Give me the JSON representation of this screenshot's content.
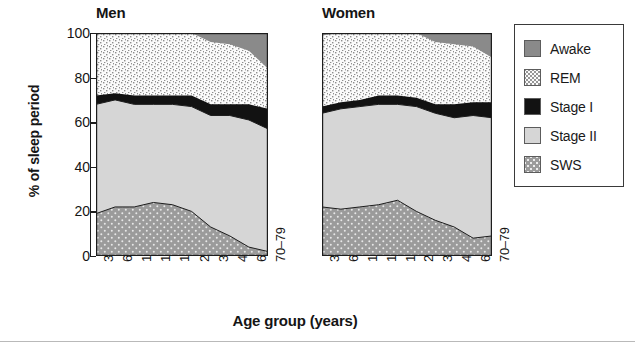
{
  "figure": {
    "ylabel": "% of sleep period",
    "xlabel": "Age group (years)",
    "panels": [
      {
        "id": "men",
        "title": "Men"
      },
      {
        "id": "women",
        "title": "Women"
      }
    ]
  },
  "legend": {
    "items": [
      {
        "label": "Awake",
        "key": "awake",
        "color": "#8a8a8a",
        "pattern": "solid"
      },
      {
        "label": "REM",
        "key": "rem",
        "color": "#f2f2f2",
        "pattern": "dotted-light"
      },
      {
        "label": "Stage I",
        "key": "stage_i",
        "color": "#121212",
        "pattern": "solid"
      },
      {
        "label": "Stage II",
        "key": "stage_ii",
        "color": "#d6d6d6",
        "pattern": "solid"
      },
      {
        "label": "SWS",
        "key": "sws",
        "color": "#9b9b9b",
        "pattern": "dotted-dark"
      }
    ]
  },
  "chart_data": {
    "type": "area",
    "title": "",
    "xlabel": "Age group (years)",
    "ylabel": "% of sleep period",
    "ylim": [
      0,
      100
    ],
    "yticks": [
      0,
      20,
      40,
      60,
      80,
      100
    ],
    "grid": false,
    "stacked": true,
    "legend_position": "right",
    "categories": [
      "3–5",
      "6–9",
      "10–12",
      "13–15",
      "16–19",
      "20–29",
      "30–39",
      "40–59",
      "60–69",
      "70–79"
    ],
    "stack_order_bottom_to_top": [
      "SWS",
      "Stage II",
      "Stage I",
      "REM",
      "Awake"
    ],
    "panels": [
      {
        "name": "Men",
        "series": [
          {
            "name": "SWS",
            "values": [
              19,
              22,
              22,
              24,
              23,
              20,
              13,
              9,
              4,
              2
            ]
          },
          {
            "name": "Stage II",
            "values": [
              49,
              48,
              46,
              44,
              45,
              47,
              50,
              54,
              57,
              55
            ]
          },
          {
            "name": "Stage I",
            "values": [
              4,
              3,
              4,
              4,
              4,
              5,
              5,
              5,
              7,
              9
            ]
          },
          {
            "name": "REM",
            "values": [
              28,
              27,
              28,
              28,
              28,
              28,
              28,
              27,
              24,
              18
            ]
          },
          {
            "name": "Awake",
            "values": [
              0,
              0,
              0,
              0,
              0,
              0,
              4,
              5,
              8,
              16
            ]
          }
        ],
        "cumulative_tops": {
          "sws": [
            19,
            22,
            22,
            24,
            23,
            20,
            13,
            9,
            4,
            2
          ],
          "stage_ii": [
            68,
            70,
            68,
            68,
            68,
            67,
            63,
            63,
            61,
            57
          ],
          "stage_i": [
            72,
            73,
            72,
            72,
            72,
            72,
            68,
            68,
            68,
            66
          ],
          "rem": [
            100,
            100,
            100,
            100,
            100,
            100,
            96,
            95,
            92,
            84
          ],
          "awake": [
            100,
            100,
            100,
            100,
            100,
            100,
            100,
            100,
            100,
            100
          ]
        }
      },
      {
        "name": "Women",
        "series": [
          {
            "name": "SWS",
            "values": [
              22,
              21,
              22,
              23,
              25,
              20,
              16,
              13,
              8,
              9
            ]
          },
          {
            "name": "Stage II",
            "values": [
              42,
              45,
              45,
              45,
              43,
              47,
              48,
              49,
              55,
              53
            ]
          },
          {
            "name": "Stage I",
            "values": [
              3,
              3,
              3,
              4,
              4,
              4,
              4,
              6,
              6,
              7
            ]
          },
          {
            "name": "REM",
            "values": [
              32,
              31,
              30,
              28,
              28,
              29,
              28,
              27,
              25,
              20
            ]
          },
          {
            "name": "Awake",
            "values": [
              1,
              0,
              0,
              0,
              0,
              0,
              4,
              5,
              6,
              11
            ]
          }
        ],
        "cumulative_tops": {
          "sws": [
            22,
            21,
            22,
            23,
            25,
            20,
            16,
            13,
            8,
            9
          ],
          "stage_ii": [
            64,
            66,
            67,
            68,
            68,
            67,
            64,
            62,
            63,
            62
          ],
          "stage_i": [
            67,
            69,
            70,
            72,
            72,
            71,
            68,
            68,
            69,
            69
          ],
          "rem": [
            99,
            100,
            100,
            100,
            100,
            100,
            96,
            95,
            94,
            89
          ],
          "awake": [
            100,
            100,
            100,
            100,
            100,
            100,
            100,
            100,
            100,
            100
          ]
        }
      }
    ]
  },
  "geometry": {
    "plot_top_y": 33,
    "plot_bottom_y": 256,
    "men_left_x": 96,
    "men_right_x": 268,
    "women_left_x": 322,
    "women_right_x": 492
  }
}
